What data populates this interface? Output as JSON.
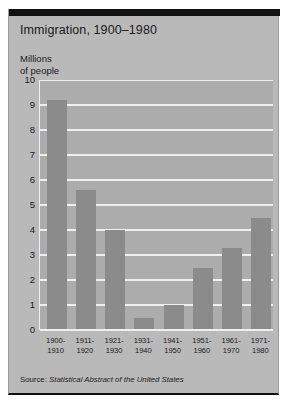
{
  "card": {
    "title": "Immigration, 1900–1980",
    "axis_caption_line1": "Millions",
    "axis_caption_line2": "of people",
    "source_prefix": "Source: ",
    "source_title": "Statistical Abstract of the United States",
    "colors": {
      "card_background": "#b9b9b9",
      "plot_background": "#acacac",
      "bar_fill": "#8b8b8b",
      "gridline": "#efefef",
      "top_rule": "#121212",
      "text": "#1a1a1a"
    }
  },
  "chart_data": {
    "type": "bar",
    "title": "Immigration, 1900–1980",
    "xlabel": "",
    "ylabel": "Millions of people",
    "ylim": [
      0,
      10
    ],
    "yticks": [
      0,
      1,
      2,
      3,
      4,
      5,
      6,
      7,
      8,
      9,
      10
    ],
    "ytick_labels": [
      "0",
      "1",
      "2",
      "3",
      "4",
      "5",
      "6",
      "7",
      "8",
      "9",
      "10"
    ],
    "grid": true,
    "legend": false,
    "categories": [
      "1900–1910",
      "1911–1920",
      "1921–1930",
      "1931–1940",
      "1941–1950",
      "1951–1960",
      "1961–1970",
      "1971–1980"
    ],
    "category_lines": [
      [
        "1900-",
        "1910"
      ],
      [
        "1911-",
        "1920"
      ],
      [
        "1921-",
        "1930"
      ],
      [
        "1931-",
        "1940"
      ],
      [
        "1941-",
        "1950"
      ],
      [
        "1951-",
        "1960"
      ],
      [
        "1961-",
        "1970"
      ],
      [
        "1971-",
        "1980"
      ]
    ],
    "values": [
      9.2,
      5.6,
      4.0,
      0.5,
      1.0,
      2.5,
      3.3,
      4.5
    ],
    "units": "millions of people",
    "source": "Source: Statistical Abstract of the United States"
  }
}
